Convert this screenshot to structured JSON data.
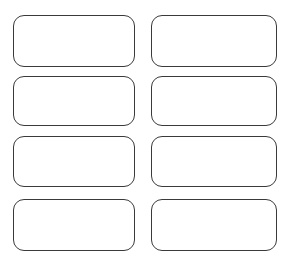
{
  "sheet": {
    "title": "Blank Label Template Sheet",
    "background_color": "#ffffff",
    "width": 291,
    "height": 264,
    "columns": 2,
    "rows": 4,
    "label_count": 8
  },
  "style": {
    "border_color": "#3a3a3a",
    "fill_color": "#ffffff",
    "border_width": "1.5px",
    "corner_radius": "11px"
  },
  "labels": [
    {
      "id": "label-1",
      "row": 1,
      "column": "left",
      "text": ""
    },
    {
      "id": "label-2",
      "row": 1,
      "column": "right",
      "text": ""
    },
    {
      "id": "label-3",
      "row": 2,
      "column": "left",
      "text": ""
    },
    {
      "id": "label-4",
      "row": 2,
      "column": "right",
      "text": ""
    },
    {
      "id": "label-5",
      "row": 3,
      "column": "left",
      "text": ""
    },
    {
      "id": "label-6",
      "row": 3,
      "column": "right",
      "text": ""
    },
    {
      "id": "label-7",
      "row": 4,
      "column": "left",
      "text": ""
    },
    {
      "id": "label-8",
      "row": 4,
      "column": "right",
      "text": ""
    }
  ]
}
